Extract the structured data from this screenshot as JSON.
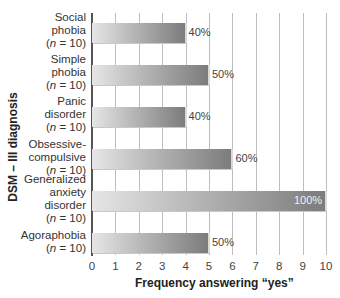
{
  "chart_data": {
    "type": "bar",
    "orientation": "horizontal",
    "title": "",
    "xlabel": "Frequency answering “yes”",
    "ylabel": "DSM – III diagnosis",
    "xlim": [
      0,
      10
    ],
    "xticks": [
      "0",
      "1",
      "2",
      "3",
      "4",
      "5",
      "6",
      "7",
      "8",
      "9",
      "10"
    ],
    "grid": true,
    "legend": null,
    "categories": [
      {
        "name": "Social phobia",
        "lines": [
          "Social",
          "phobia"
        ],
        "n": "(n = 10)"
      },
      {
        "name": "Simple phobia",
        "lines": [
          "Simple",
          "phobia"
        ],
        "n": "(n = 10)"
      },
      {
        "name": "Panic disorder",
        "lines": [
          "Panic",
          "disorder"
        ],
        "n": "(n = 10)"
      },
      {
        "name": "Obsessive-compulsive",
        "lines": [
          "Obsessive-",
          "compulsive"
        ],
        "n": "(n = 10)"
      },
      {
        "name": "Generalized anxiety disorder",
        "lines": [
          "Generalized",
          "anxiety",
          "disorder"
        ],
        "n": "(n = 10)"
      },
      {
        "name": "Agoraphobia",
        "lines": [
          "Agoraphobia"
        ],
        "n": "(n = 10)"
      }
    ],
    "values": [
      4,
      5,
      4,
      6,
      10,
      5
    ],
    "data_labels": [
      "40%",
      "50%",
      "40%",
      "60%",
      "100%",
      "50%"
    ]
  }
}
